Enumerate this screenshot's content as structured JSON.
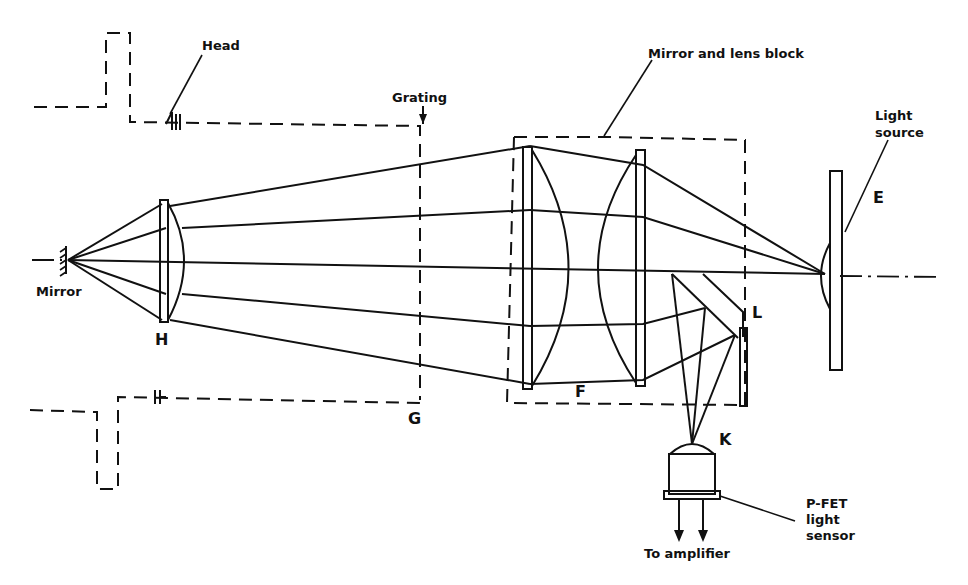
{
  "diagram": {
    "type": "optical-schematic",
    "labels": {
      "head": "Head",
      "grating": "Grating",
      "mirror_and_lens_block": "Mirror and lens block",
      "light_source_line1": "Light",
      "light_source_line2": "source",
      "mirror": "Mirror",
      "h": "H",
      "g": "G",
      "f": "F",
      "e": "E",
      "l": "L",
      "k": "K",
      "pfet_line1": "P-FET",
      "pfet_line2": "light",
      "pfet_line3": "sensor",
      "to_amplifier": "To amplifier"
    },
    "components": [
      {
        "id": "mirror",
        "label": "Mirror"
      },
      {
        "id": "H",
        "label": "H",
        "kind": "collimating lens"
      },
      {
        "id": "G",
        "label": "G",
        "kind": "grating"
      },
      {
        "id": "F",
        "label": "F",
        "kind": "lens pair in mirror and lens block"
      },
      {
        "id": "L",
        "label": "L",
        "kind": "beam-splitter prism"
      },
      {
        "id": "E",
        "label": "E",
        "kind": "light source"
      },
      {
        "id": "K",
        "label": "K",
        "kind": "P-FET light sensor"
      }
    ]
  }
}
